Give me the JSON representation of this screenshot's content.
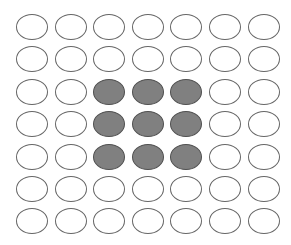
{
  "diagram": {
    "title": "",
    "rows": 7,
    "cols": 7,
    "origin": {
      "x": 16,
      "y": 14
    },
    "pitch": {
      "x": 38.6,
      "y": 32.4
    },
    "colors": {
      "empty_fill": "#ffffff",
      "empty_stroke": "#666666",
      "filled_fill": "#808080",
      "filled_stroke": "#505050"
    },
    "cells": [
      [
        0,
        0,
        0,
        0,
        0,
        0,
        0
      ],
      [
        0,
        0,
        0,
        0,
        0,
        0,
        0
      ],
      [
        0,
        0,
        1,
        1,
        1,
        0,
        0
      ],
      [
        0,
        0,
        1,
        1,
        1,
        0,
        0
      ],
      [
        0,
        0,
        1,
        1,
        1,
        0,
        0
      ],
      [
        0,
        0,
        0,
        0,
        0,
        0,
        0
      ],
      [
        0,
        0,
        0,
        0,
        0,
        0,
        0
      ]
    ]
  }
}
